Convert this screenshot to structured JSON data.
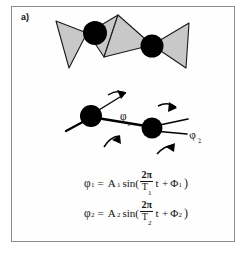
{
  "figure": {
    "panel_label": "a)",
    "frame_color": "#8c8c8c",
    "background_color": "#ffffff"
  },
  "diagrams": {
    "tetrahedra_chain": {
      "name": "tetrahedra-chain-diagram",
      "polygon_fill": "#c8c8c8",
      "polygon_stroke": "#1a1a1a",
      "atom_color": "#000000",
      "atom_count": 2,
      "polygon_count": 4
    },
    "bond_angle_schematic": {
      "name": "bond-angle-schematic",
      "atom_color": "#000000",
      "bond_color": "#000000",
      "atom_count": 2,
      "angle_labels": [
        "φ",
        "φ"
      ],
      "rotation_arrow_count": 4
    }
  },
  "labels": {
    "phi_1": "φ",
    "phi_1_sub": "1",
    "phi_2": "φ",
    "phi_2_sub": "2"
  },
  "equations": [
    {
      "id": "equation-1",
      "lhs_symbol": "φ",
      "lhs_sub": "1",
      "equals": "=",
      "amplitude": "A",
      "amplitude_sub": "1",
      "function": "sin(",
      "numerator": "2π",
      "denominator": "T",
      "denominator_sub": "1",
      "variable": "t",
      "operator": "+",
      "phase": "Φ",
      "phase_sub": "1",
      "close_paren": ")",
      "plain_text": "φ₁ = A₁ sin( 2π/T₁ t + Φ₁ )"
    },
    {
      "id": "equation-2",
      "lhs_symbol": "φ",
      "lhs_sub": "2",
      "equals": "=",
      "amplitude": "A",
      "amplitude_sub": "2",
      "function": "sin(",
      "numerator": "2π",
      "denominator": "T",
      "denominator_sub": "2",
      "variable": "t",
      "operator": "+",
      "phase": "Φ",
      "phase_sub": "2",
      "close_paren": ")",
      "plain_text": "φ₂ = A₂ sin( 2π/T₂ t + Φ₂ )"
    }
  ]
}
